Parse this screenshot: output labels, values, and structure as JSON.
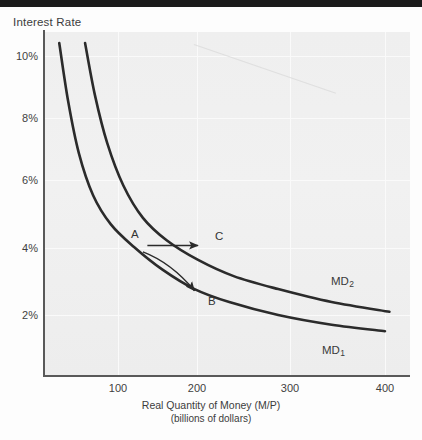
{
  "figure": {
    "y_axis_title": "Interest Rate",
    "x_axis_title": "Real Quantity of Money (M/P)",
    "x_axis_subtitle": "(billions of dollars)"
  },
  "chart_data": {
    "type": "line",
    "title": "",
    "xlabel": "Real Quantity of Money (M/P) (billions of dollars)",
    "ylabel": "Interest Rate",
    "xlim": [
      0,
      430
    ],
    "ylim": [
      0,
      11
    ],
    "xticks": [
      100,
      200,
      300,
      400
    ],
    "xticklabels": [
      "100",
      "200",
      "300",
      "400"
    ],
    "yticks": [
      2,
      4,
      6,
      8,
      10
    ],
    "yticklabels": [
      "2%",
      "4%",
      "6%",
      "8%",
      "10%"
    ],
    "grid": true,
    "legend": "none",
    "series": [
      {
        "name": "MD1",
        "label": "MD",
        "label_sub": "1",
        "points": [
          {
            "x": 34,
            "y": 10.4
          },
          {
            "x": 44,
            "y": 8.6
          },
          {
            "x": 56,
            "y": 7.0
          },
          {
            "x": 72,
            "y": 5.7
          },
          {
            "x": 92,
            "y": 4.8
          },
          {
            "x": 118,
            "y": 4.1
          },
          {
            "x": 150,
            "y": 3.4
          },
          {
            "x": 186,
            "y": 2.8
          },
          {
            "x": 225,
            "y": 2.4
          },
          {
            "x": 280,
            "y": 2.0
          },
          {
            "x": 340,
            "y": 1.7
          },
          {
            "x": 400,
            "y": 1.5
          }
        ]
      },
      {
        "name": "MD2",
        "label": "MD",
        "label_sub": "2",
        "points": [
          {
            "x": 63,
            "y": 10.4
          },
          {
            "x": 74,
            "y": 8.8
          },
          {
            "x": 88,
            "y": 7.3
          },
          {
            "x": 106,
            "y": 6.0
          },
          {
            "x": 128,
            "y": 5.0
          },
          {
            "x": 155,
            "y": 4.3
          },
          {
            "x": 190,
            "y": 3.7
          },
          {
            "x": 230,
            "y": 3.2
          },
          {
            "x": 280,
            "y": 2.8
          },
          {
            "x": 340,
            "y": 2.4
          },
          {
            "x": 405,
            "y": 2.1
          }
        ]
      }
    ],
    "annotations": [
      {
        "name": "point-a",
        "text": "A",
        "x": 124,
        "y": 4.2
      },
      {
        "name": "point-c",
        "text": "C",
        "x": 222,
        "y": 4.25
      },
      {
        "name": "point-b",
        "text": "B",
        "x": 210,
        "y": 2.45
      },
      {
        "name": "curve-label-md2",
        "text": "MD2",
        "x": 330,
        "y": 3.1
      },
      {
        "name": "curve-label-md1",
        "text": "MD1",
        "x": 318,
        "y": 1.45
      }
    ],
    "arrows": [
      {
        "name": "shift-arrow-a-to-c",
        "from": {
          "x": 133,
          "y": 4.15
        },
        "to": {
          "x": 190,
          "y": 4.15
        },
        "style": "straight"
      },
      {
        "name": "movement-arrow-a-to-b",
        "from": {
          "x": 128,
          "y": 3.95
        },
        "to": {
          "x": 186,
          "y": 2.75
        },
        "style": "curved"
      }
    ]
  },
  "labels": {
    "point_a": "A",
    "point_b": "B",
    "point_c": "C",
    "md1_base": "MD",
    "md1_sub": "1",
    "md2_base": "MD",
    "md2_sub": "2"
  },
  "ticks": {
    "y": [
      "10%",
      "8%",
      "6%",
      "4%",
      "2%"
    ],
    "x": [
      "100",
      "200",
      "300",
      "400"
    ]
  }
}
